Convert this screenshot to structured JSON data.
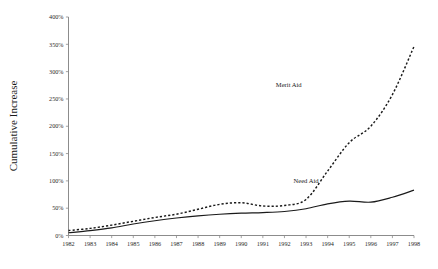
{
  "chart_data": {
    "type": "line",
    "title": "",
    "xlabel": "",
    "ylabel": "Cumulative Increase",
    "x": [
      1982,
      1983,
      1984,
      1985,
      1986,
      1987,
      1988,
      1989,
      1990,
      1991,
      1992,
      1993,
      1994,
      1995,
      1996,
      1997,
      1998
    ],
    "xtick_labels": [
      "1982",
      "1983",
      "1984",
      "1985",
      "1986",
      "1987",
      "1988",
      "1989",
      "1990",
      "1991",
      "1992",
      "1993",
      "1994",
      "1995",
      "1996",
      "1997",
      "1998"
    ],
    "ytick_labels": [
      "0%",
      "50%",
      "100%",
      "150%",
      "200%",
      "250%",
      "300%",
      "350%",
      "400%"
    ],
    "ytick_values": [
      0,
      50,
      100,
      150,
      200,
      250,
      300,
      350,
      400
    ],
    "ylim": [
      0,
      400
    ],
    "xlim": [
      1982,
      1998
    ],
    "grid": false,
    "legend_position": "inline-annotation",
    "series": [
      {
        "name": "Merit Aid",
        "style": "dashed",
        "color": "#1a1a1a",
        "label_x": 1992.2,
        "label_y": 272,
        "values": [
          9,
          13,
          19,
          26,
          33,
          39,
          48,
          57,
          60,
          54,
          55,
          66,
          118,
          170,
          200,
          258,
          346
        ]
      },
      {
        "name": "Need Aid",
        "style": "solid",
        "color": "#1a1a1a",
        "label_x": 1993.0,
        "label_y": 96,
        "values": [
          5,
          9,
          14,
          21,
          27,
          32,
          36,
          39,
          41,
          42,
          44,
          49,
          58,
          63,
          61,
          70,
          83
        ]
      }
    ],
    "annotations": [
      {
        "text": "Merit Aid",
        "x": 1992.2,
        "y": 272
      },
      {
        "text": "Need Aid",
        "x": 1993.0,
        "y": 96
      }
    ]
  },
  "axis": {
    "y_title": "Cumulative Increase"
  }
}
